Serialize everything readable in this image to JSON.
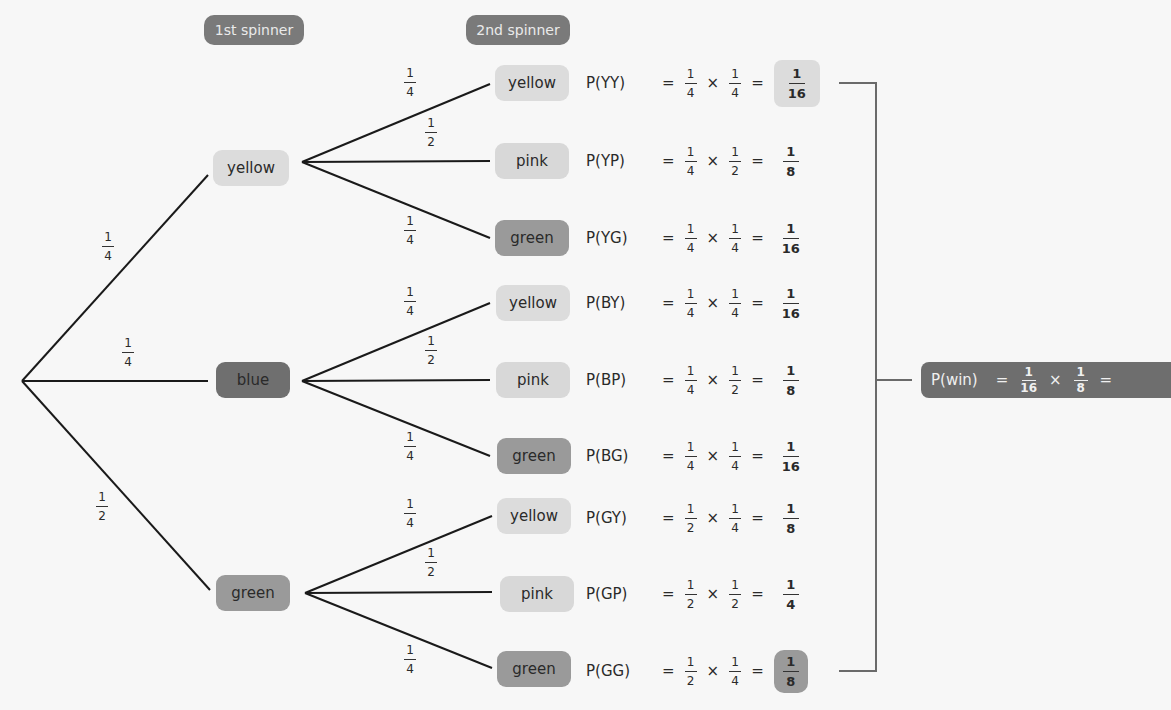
{
  "headers": {
    "first": "1st spinner",
    "second": "2nd spinner"
  },
  "first_level": [
    {
      "label": "yellow",
      "prob": {
        "num": "1",
        "den": "4"
      }
    },
    {
      "label": "blue",
      "prob": {
        "num": "1",
        "den": "4"
      }
    },
    {
      "label": "green",
      "prob": {
        "num": "1",
        "den": "2"
      }
    }
  ],
  "second_level_probs": [
    {
      "label": "yellow",
      "num": "1",
      "den": "4"
    },
    {
      "label": "pink",
      "num": "1",
      "den": "2"
    },
    {
      "label": "green",
      "num": "1",
      "den": "4"
    }
  ],
  "outcomes": [
    {
      "group": "yellow",
      "node": "yellow",
      "label": "P(YY)",
      "a": [
        "1",
        "4"
      ],
      "b": [
        "1",
        "4"
      ],
      "result": [
        "1",
        "16"
      ],
      "highlight": "yellow"
    },
    {
      "group": "yellow",
      "node": "pink",
      "label": "P(YP)",
      "a": [
        "1",
        "4"
      ],
      "b": [
        "1",
        "2"
      ],
      "result": [
        "1",
        "8"
      ],
      "highlight": ""
    },
    {
      "group": "yellow",
      "node": "green",
      "label": "P(YG)",
      "a": [
        "1",
        "4"
      ],
      "b": [
        "1",
        "4"
      ],
      "result": [
        "1",
        "16"
      ],
      "highlight": ""
    },
    {
      "group": "blue",
      "node": "yellow",
      "label": "P(BY)",
      "a": [
        "1",
        "4"
      ],
      "b": [
        "1",
        "4"
      ],
      "result": [
        "1",
        "16"
      ],
      "highlight": ""
    },
    {
      "group": "blue",
      "node": "pink",
      "label": "P(BP)",
      "a": [
        "1",
        "4"
      ],
      "b": [
        "1",
        "2"
      ],
      "result": [
        "1",
        "8"
      ],
      "highlight": ""
    },
    {
      "group": "blue",
      "node": "green",
      "label": "P(BG)",
      "a": [
        "1",
        "4"
      ],
      "b": [
        "1",
        "4"
      ],
      "result": [
        "1",
        "16"
      ],
      "highlight": ""
    },
    {
      "group": "green",
      "node": "yellow",
      "label": "P(GY)",
      "a": [
        "1",
        "2"
      ],
      "b": [
        "1",
        "4"
      ],
      "result": [
        "1",
        "8"
      ],
      "highlight": ""
    },
    {
      "group": "green",
      "node": "pink",
      "label": "P(GP)",
      "a": [
        "1",
        "2"
      ],
      "b": [
        "1",
        "2"
      ],
      "result": [
        "1",
        "4"
      ],
      "highlight": ""
    },
    {
      "group": "green",
      "node": "green",
      "label": "P(GG)",
      "a": [
        "1",
        "2"
      ],
      "b": [
        "1",
        "4"
      ],
      "result": [
        "1",
        "8"
      ],
      "highlight": "green"
    }
  ],
  "symbols": {
    "equals": "=",
    "times": "×"
  },
  "win": {
    "label": "P(win)",
    "a": [
      "1",
      "16"
    ],
    "b": [
      "1",
      "8"
    ]
  }
}
